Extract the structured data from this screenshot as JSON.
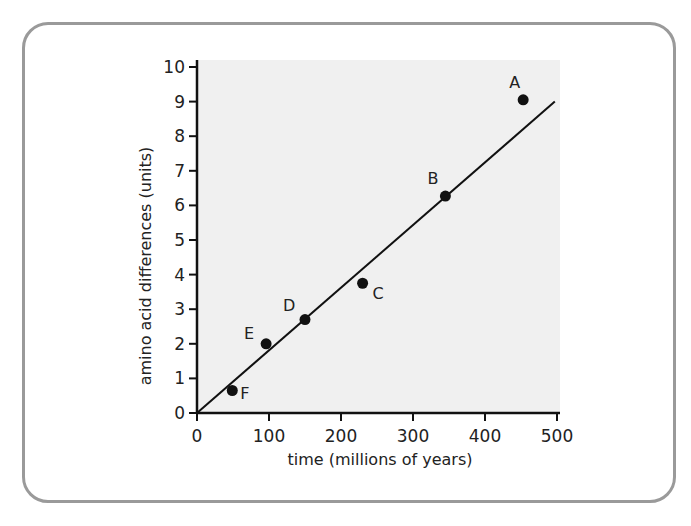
{
  "chart_data": {
    "type": "scatter",
    "title": "",
    "xlabel": "time (millions of years)",
    "ylabel": "amino acid differences (units)",
    "xlim": [
      0,
      500
    ],
    "ylim": [
      0,
      10
    ],
    "x_ticks": [
      0,
      100,
      200,
      300,
      400,
      500
    ],
    "y_ticks": [
      0,
      1,
      2,
      3,
      4,
      5,
      6,
      7,
      8,
      9,
      10
    ],
    "grid": false,
    "legend": null,
    "points": [
      {
        "label": "A",
        "x": 453,
        "y": 9.05
      },
      {
        "label": "B",
        "x": 345,
        "y": 6.27
      },
      {
        "label": "C",
        "x": 230,
        "y": 3.75
      },
      {
        "label": "D",
        "x": 150,
        "y": 2.7
      },
      {
        "label": "E",
        "x": 96,
        "y": 2.0
      },
      {
        "label": "F",
        "x": 49,
        "y": 0.65
      }
    ],
    "trendline": {
      "x": [
        0,
        497
      ],
      "y": [
        0,
        9.0
      ]
    }
  },
  "colors": {
    "plot_background": "#f0f0f0",
    "frame": "#9a9a9a",
    "axis": "#111111",
    "point": "#111111"
  }
}
